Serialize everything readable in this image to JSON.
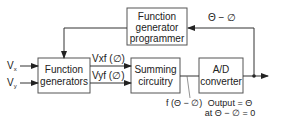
{
  "diagram": {
    "blocks": {
      "programmer": {
        "line1": "Function",
        "line2": "generator",
        "line3": "programmer"
      },
      "function_generators": {
        "line1": "Function",
        "line2": "generators"
      },
      "summing": {
        "line1": "Summing",
        "line2": "circuitry"
      },
      "ad_converter": {
        "line1": "A/D",
        "line2": "converter"
      }
    },
    "inputs": {
      "vx": {
        "main": "V",
        "sub": "x"
      },
      "vy": {
        "main": "V",
        "sub": "y"
      }
    },
    "signals": {
      "vxf": "Vxf (∅)",
      "vyf": "Vyf (∅)",
      "feedback": "Θ − ∅",
      "error": "f (Θ − ∅)",
      "output_line1": "Output = Θ",
      "output_line2": "at Θ − ∅ = 0"
    },
    "colors": {
      "stroke": "#333333",
      "box_border": "#555555",
      "text": "#222222"
    }
  }
}
